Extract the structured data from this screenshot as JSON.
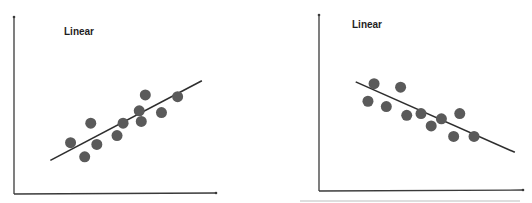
{
  "chart_data": [
    {
      "type": "scatter",
      "title": "Linear",
      "xlabel": "",
      "ylabel": "",
      "xlim": [
        0,
        10
      ],
      "ylim": [
        0,
        10
      ],
      "grid": false,
      "ticks": false,
      "colors": {
        "points": "#5a5a5a",
        "line": "#2e2e2e",
        "axes": "#3a3a3a"
      },
      "points": [
        {
          "x": 2.8,
          "y": 2.9
        },
        {
          "x": 3.5,
          "y": 2.1
        },
        {
          "x": 3.8,
          "y": 4.0
        },
        {
          "x": 4.1,
          "y": 2.8
        },
        {
          "x": 5.1,
          "y": 3.3
        },
        {
          "x": 5.4,
          "y": 4.0
        },
        {
          "x": 6.2,
          "y": 4.7
        },
        {
          "x": 6.3,
          "y": 4.1
        },
        {
          "x": 6.5,
          "y": 5.6
        },
        {
          "x": 7.3,
          "y": 4.6
        },
        {
          "x": 8.1,
          "y": 5.5
        }
      ],
      "fit_line": {
        "x": [
          1.8,
          9.3
        ],
        "y": [
          1.9,
          6.4
        ],
        "trend": "positive"
      }
    },
    {
      "type": "scatter",
      "title": "Linear",
      "xlabel": "",
      "ylabel": "",
      "xlim": [
        0,
        10
      ],
      "ylim": [
        0,
        10
      ],
      "grid": false,
      "ticks": false,
      "colors": {
        "points": "#5a5a5a",
        "line": "#2e2e2e",
        "axes": "#3a3a3a"
      },
      "points": [
        {
          "x": 2.7,
          "y": 6.1
        },
        {
          "x": 2.4,
          "y": 5.1
        },
        {
          "x": 3.3,
          "y": 4.8
        },
        {
          "x": 4.0,
          "y": 5.9
        },
        {
          "x": 4.3,
          "y": 4.3
        },
        {
          "x": 5.0,
          "y": 4.4
        },
        {
          "x": 5.5,
          "y": 3.7
        },
        {
          "x": 6.0,
          "y": 4.1
        },
        {
          "x": 6.9,
          "y": 4.4
        },
        {
          "x": 6.6,
          "y": 3.1
        },
        {
          "x": 7.6,
          "y": 3.1
        }
      ],
      "fit_line": {
        "x": [
          1.8,
          9.6
        ],
        "y": [
          6.2,
          2.2
        ],
        "trend": "negative"
      }
    }
  ]
}
